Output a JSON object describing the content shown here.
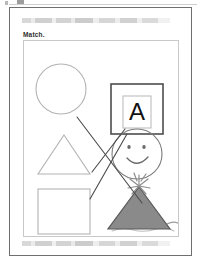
{
  "document": {
    "type": "worksheet-scan",
    "prompt": "Match.",
    "header_band_text": "",
    "footer_band_text": "",
    "letter_card_glyph": "A"
  },
  "colors": {
    "page_border": "#6f6f6f",
    "frame_border": "#c9c9c9",
    "shape_stroke": "#b3b3b3",
    "ink_stroke": "#4a4a4a",
    "hat_fill": "#8a8a8a",
    "hat_stroke": "#585858",
    "letter_outer_stroke": "#4d4d4d",
    "letter_inner_stroke": "#bdbdbd",
    "glyph_color": "#111111",
    "band_gray": "#cfcfcf",
    "paper": "#ffffff"
  },
  "left_column": [
    {
      "name": "circle",
      "label": "circle-shape"
    },
    {
      "name": "triangle",
      "label": "triangle-shape"
    },
    {
      "name": "square",
      "label": "square-shape"
    }
  ],
  "right_column": [
    {
      "name": "letter-a-card",
      "label": "letter-a-card"
    },
    {
      "name": "smiley-face",
      "label": "smiley-face"
    },
    {
      "name": "party-hat",
      "label": "party-hat"
    }
  ],
  "match_lines": [
    {
      "from": "circle",
      "to": "party-hat",
      "x1": 53,
      "y1": 76,
      "x2": 118,
      "y2": 162
    },
    {
      "from": "triangle",
      "to": "letter-a-card",
      "x1": 76,
      "y1": 124,
      "x2": 100,
      "y2": 86
    },
    {
      "from": "square",
      "to": "smiley-face",
      "x1": 70,
      "y1": 157,
      "x2": 100,
      "y2": 90
    }
  ]
}
